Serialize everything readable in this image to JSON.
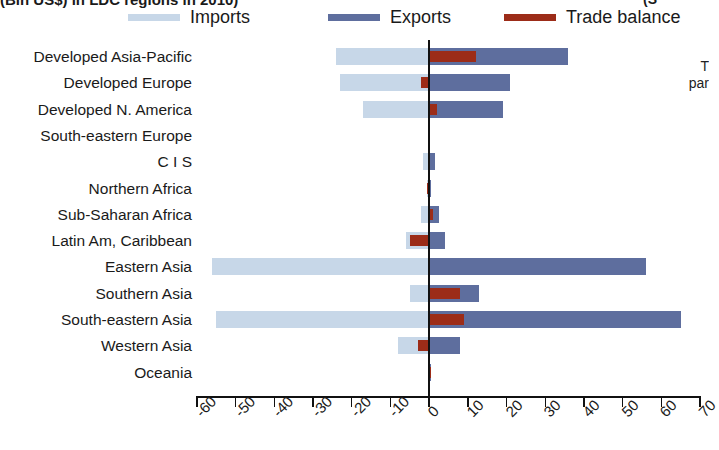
{
  "title": {
    "clipped_top_left": "(Bln US$) in LDC regions in 2010)",
    "clipped_top_right": "(S"
  },
  "side_note": {
    "line1": "T",
    "line2": "par"
  },
  "legend": {
    "items": [
      {
        "label": "Imports",
        "color": "#c7d7e8",
        "x": 0
      },
      {
        "label": "Exports",
        "color": "#5e6e9e",
        "x": 200
      },
      {
        "label": "Trade balance",
        "color": "#9c2c18",
        "x": 376
      }
    ]
  },
  "chart_data": {
    "type": "bar",
    "orientation": "horizontal",
    "title": "(Bln US$) in LDC regions in 2010)",
    "xlabel": "",
    "ylabel": "",
    "xlim": [
      -60,
      70
    ],
    "xticks": [
      -60,
      -50,
      -40,
      -30,
      -20,
      -10,
      0,
      10,
      20,
      30,
      40,
      50,
      60,
      70
    ],
    "xticklabels": [
      "-60",
      "-50",
      "-40",
      "-30",
      "-20",
      "-10",
      "0",
      "10",
      "20",
      "30",
      "40",
      "50",
      "60",
      "70"
    ],
    "grid": false,
    "legend_position": "top",
    "zero_reference_line": 0,
    "categories": [
      "Developed Asia-Pacific",
      "Developed Europe",
      "Developed N. America",
      "South-eastern Europe",
      "C I S",
      "Northern Africa",
      "Sub-Saharan Africa",
      "Latin Am, Caribbean",
      "Eastern Asia",
      "Southern Asia",
      "South-eastern Asia",
      "Western Asia",
      "Oceania"
    ],
    "series": [
      {
        "name": "Imports",
        "color": "#c7d7e8",
        "values": [
          -24,
          -23,
          -17,
          -0.3,
          -1.5,
          -0.6,
          -2.0,
          -6.0,
          -56,
          -5.0,
          -55,
          -8.0,
          -0.3
        ]
      },
      {
        "name": "Exports",
        "color": "#5e6e9e",
        "values": [
          36,
          21,
          19,
          0.3,
          1.6,
          0.6,
          2.6,
          4.0,
          56,
          13,
          65,
          8.0,
          0.6
        ]
      },
      {
        "name": "Trade balance",
        "color": "#9c2c18",
        "values": [
          12,
          -2.0,
          2.0,
          0.0,
          0.1,
          -0.6,
          1.0,
          -5.0,
          0.3,
          8.0,
          9.0,
          -3.0,
          0.4
        ]
      }
    ]
  }
}
